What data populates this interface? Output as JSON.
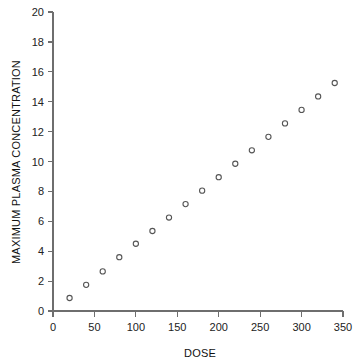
{
  "chart_data": {
    "type": "scatter",
    "title": "",
    "xlabel": "DOSE",
    "ylabel": "MAXIMUM PLASMA CONCENTRATION",
    "xlim": [
      0,
      350
    ],
    "ylim": [
      0,
      20
    ],
    "xticks": [
      0,
      50,
      100,
      150,
      200,
      250,
      300,
      350
    ],
    "yticks": [
      0,
      2,
      4,
      6,
      8,
      10,
      12,
      14,
      16,
      18,
      20
    ],
    "xtick_labels": [
      "0",
      "50",
      "100",
      "150",
      "200",
      "250",
      "300",
      "350"
    ],
    "ytick_labels": [
      "0",
      "2",
      "4",
      "6",
      "8",
      "10",
      "12",
      "14",
      "16",
      "18",
      "20"
    ],
    "grid": false,
    "legend": false,
    "marker": "open-circle",
    "marker_color": "#555555",
    "x": [
      20,
      40,
      60,
      80,
      100,
      120,
      140,
      160,
      180,
      200,
      220,
      240,
      260,
      280,
      300,
      320,
      340
    ],
    "y": [
      0.87,
      1.75,
      2.65,
      3.6,
      4.5,
      5.35,
      6.25,
      7.15,
      8.05,
      8.95,
      9.85,
      10.75,
      11.65,
      12.55,
      13.45,
      14.35,
      15.25
    ]
  }
}
